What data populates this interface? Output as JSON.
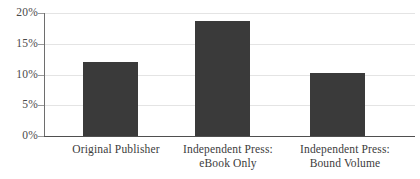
{
  "chart_data": {
    "type": "bar",
    "title": "",
    "subtitle": "",
    "xlabel": "",
    "ylabel": "",
    "categories": [
      "Original Publisher",
      "Independent Press: eBook Only",
      "Independent Press: Bound Volume"
    ],
    "category_lines": [
      [
        "Original Publisher",
        ""
      ],
      [
        "Independent Press:",
        "eBook Only"
      ],
      [
        "Independent Press:",
        "Bound Volume"
      ]
    ],
    "values": [
      12.0,
      18.7,
      10.2
    ],
    "value_labels": [
      "12%",
      "18.7%",
      "10.2%"
    ],
    "ylim": [
      0,
      20
    ],
    "yticks": [
      0,
      5,
      10,
      15,
      20
    ],
    "ytick_labels": [
      "0%",
      "5%",
      "10%",
      "15%",
      "20%"
    ],
    "grid": true,
    "grid_axis": "y",
    "legend": false,
    "legend_position": "none",
    "annotations": [],
    "colors": {
      "bar_fill": "#3a3a3a",
      "gridline": "#e4e4e4",
      "axis": "#4f4f4f",
      "y_axis": "#6e6e6e",
      "tick_mark": "#9a9a9a",
      "text": "#3c3c3c",
      "background": "#ffffff"
    }
  }
}
